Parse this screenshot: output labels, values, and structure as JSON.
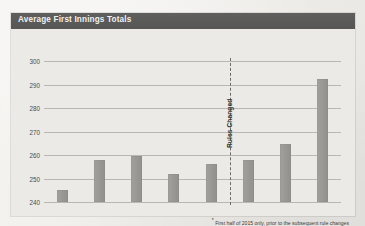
{
  "chart_panel": {
    "title": "Average First Innings Totals"
  },
  "chart_data": {
    "type": "bar",
    "title": "Average First Innings Totals",
    "xlabel": "",
    "ylabel": "",
    "categories": [
      "2008",
      "2009",
      "2010",
      "2011",
      "2012",
      "2013",
      "2014",
      "2015 *"
    ],
    "values": [
      245,
      258,
      259.5,
      252,
      256,
      258,
      264.5,
      292.5
    ],
    "ylim": [
      240,
      300
    ],
    "yticks": [
      240,
      250,
      260,
      270,
      280,
      290,
      300
    ],
    "ytick_labels": [
      "240",
      "250",
      "260",
      "270",
      "280",
      "290",
      "300"
    ],
    "grid": true,
    "legend": "none",
    "bar_color": "#9a9894",
    "annotations": [
      {
        "type": "vertical-dashed-line",
        "label": "Rules Changed",
        "position_between": [
          "2012",
          "2013"
        ],
        "orientation": "rotated-90"
      }
    ],
    "footnote": "* First half of 2015 only, prior to the subsequent rule changes"
  },
  "footnote": {
    "star": "*",
    "text": " First half of 2015 only, prior to the subsequent rule changes"
  },
  "divider": {
    "label": "Rules Changed"
  },
  "colors": {
    "header_bar": "#5a5a59",
    "bar_fill": "#9a9894",
    "panel_bg": "#eceae6",
    "gridline": "#b9b7b2"
  }
}
